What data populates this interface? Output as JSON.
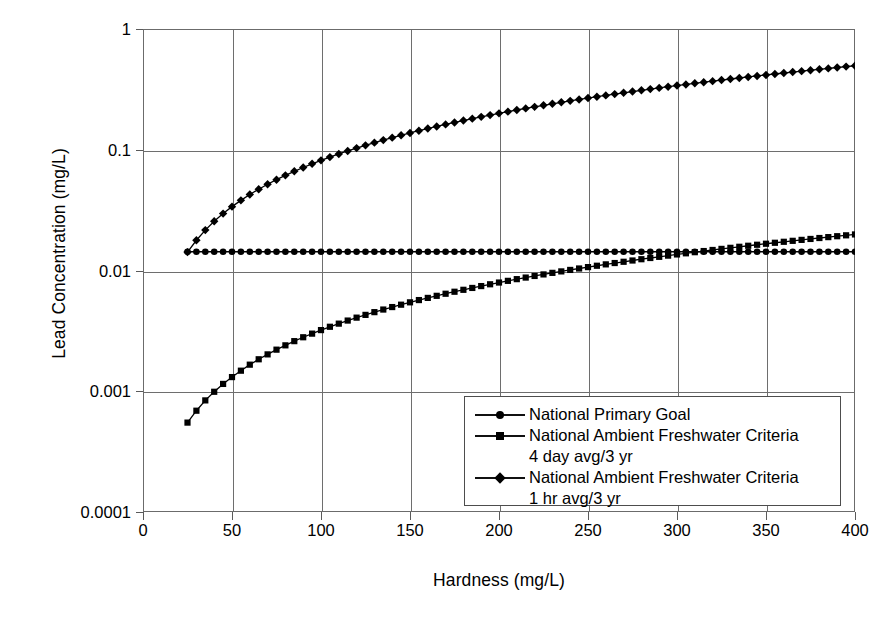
{
  "chart_data": {
    "type": "line",
    "title": "",
    "xlabel": "Hardness (mg/L)",
    "ylabel": "Lead Concentration (mg/L)",
    "yscale": "log",
    "xlim": [
      0,
      400
    ],
    "ylim": [
      0.0001,
      1
    ],
    "grid": true,
    "legend_position": "bottom-right",
    "xticks": [
      "0",
      "50",
      "100",
      "150",
      "200",
      "250",
      "300",
      "350",
      "400"
    ],
    "xtick_values": [
      0,
      50,
      100,
      150,
      200,
      250,
      300,
      350,
      400
    ],
    "yticks": [
      "1",
      "0.1",
      "0.01",
      "0.001",
      "0.0001"
    ],
    "ytick_values": [
      1,
      0.1,
      0.01,
      0.001,
      0.0001
    ],
    "x": [
      25,
      30,
      35,
      40,
      45,
      50,
      55,
      60,
      65,
      70,
      75,
      80,
      85,
      90,
      95,
      100,
      105,
      110,
      115,
      120,
      125,
      130,
      135,
      140,
      145,
      150,
      155,
      160,
      165,
      170,
      175,
      180,
      185,
      190,
      195,
      200,
      205,
      210,
      215,
      220,
      225,
      230,
      235,
      240,
      245,
      250,
      255,
      260,
      265,
      270,
      275,
      280,
      285,
      290,
      295,
      300,
      305,
      310,
      315,
      320,
      325,
      330,
      335,
      340,
      345,
      350,
      355,
      360,
      365,
      370,
      375,
      380,
      385,
      390,
      395,
      400
    ],
    "series": [
      {
        "name": "National Primary Goal",
        "marker": "circle",
        "values": [
          0.0143,
          0.0143,
          0.0143,
          0.0143,
          0.0143,
          0.0143,
          0.0143,
          0.0143,
          0.0143,
          0.0143,
          0.0143,
          0.0143,
          0.0143,
          0.0143,
          0.0143,
          0.0143,
          0.0143,
          0.0143,
          0.0143,
          0.0143,
          0.0143,
          0.0143,
          0.0143,
          0.0143,
          0.0143,
          0.0143,
          0.0143,
          0.0143,
          0.0143,
          0.0143,
          0.0143,
          0.0143,
          0.0143,
          0.0143,
          0.0143,
          0.0143,
          0.0143,
          0.0143,
          0.0143,
          0.0143,
          0.0143,
          0.0143,
          0.0143,
          0.0143,
          0.0143,
          0.0143,
          0.0143,
          0.0143,
          0.0143,
          0.0143,
          0.0143,
          0.0143,
          0.0143,
          0.0143,
          0.0143,
          0.0143,
          0.0143,
          0.0143,
          0.0143,
          0.0143,
          0.0143,
          0.0143,
          0.0143,
          0.0143,
          0.0143,
          0.0143,
          0.0143,
          0.0143,
          0.0143,
          0.0143,
          0.0143,
          0.0143,
          0.0143,
          0.0143,
          0.0143,
          0.0143
        ]
      },
      {
        "name": "National Ambient Freshwater Criteria 4 day avg/3 yr",
        "label_line1": "National Ambient Freshwater Criteria",
        "label_line2": "4 day avg/3 yr",
        "marker": "square",
        "values": [
          0.00055,
          0.00069,
          0.00084,
          0.00099,
          0.00115,
          0.00131,
          0.00148,
          0.00166,
          0.00184,
          0.00202,
          0.00221,
          0.0024,
          0.0026,
          0.0028,
          0.003,
          0.00321,
          0.00342,
          0.00363,
          0.00385,
          0.00407,
          0.00429,
          0.00452,
          0.00475,
          0.00498,
          0.00521,
          0.00545,
          0.00569,
          0.00593,
          0.00617,
          0.00642,
          0.00667,
          0.00692,
          0.00717,
          0.00743,
          0.00769,
          0.00795,
          0.00821,
          0.00848,
          0.00874,
          0.00901,
          0.00928,
          0.00956,
          0.00983,
          0.01011,
          0.01039,
          0.01067,
          0.01095,
          0.01124,
          0.01153,
          0.01181,
          0.0121,
          0.0124,
          0.01269,
          0.01298,
          0.01328,
          0.01358,
          0.01388,
          0.01418,
          0.01449,
          0.01479,
          0.0151,
          0.01541,
          0.01572,
          0.01603,
          0.01634,
          0.01666,
          0.01697,
          0.01729,
          0.01761,
          0.01793,
          0.01825,
          0.01858,
          0.0189,
          0.01923,
          0.01956,
          0.01989
        ]
      },
      {
        "name": "National Ambient Freshwater Criteria 1 hr avg/3 yr",
        "label_line1": "National Ambient Freshwater Criteria",
        "label_line2": "1 hr avg/3 yr",
        "marker": "diamond",
        "values": [
          0.0142,
          0.0178,
          0.0216,
          0.0256,
          0.0296,
          0.0338,
          0.0381,
          0.0426,
          0.0471,
          0.0518,
          0.0565,
          0.0614,
          0.0663,
          0.0713,
          0.0765,
          0.0817,
          0.0869,
          0.0923,
          0.0977,
          0.1032,
          0.1088,
          0.1145,
          0.1202,
          0.126,
          0.1318,
          0.1378,
          0.1437,
          0.1498,
          0.1559,
          0.1621,
          0.1683,
          0.1746,
          0.1809,
          0.1873,
          0.1937,
          0.2002,
          0.2068,
          0.2134,
          0.22,
          0.2267,
          0.2335,
          0.2403,
          0.2471,
          0.254,
          0.2609,
          0.2679,
          0.2749,
          0.282,
          0.2891,
          0.2963,
          0.3035,
          0.3107,
          0.318,
          0.3253,
          0.3327,
          0.3401,
          0.3475,
          0.355,
          0.3625,
          0.3701,
          0.3777,
          0.3853,
          0.393,
          0.4007,
          0.4085,
          0.4163,
          0.4241,
          0.432,
          0.4399,
          0.4478,
          0.4558,
          0.4638,
          0.4718,
          0.4799,
          0.488,
          0.4962
        ]
      }
    ]
  },
  "legend": {
    "rows": [
      {
        "marker": "circle",
        "text": "National Primary Goal"
      },
      {
        "marker": "square",
        "text": "National Ambient Freshwater Criteria"
      },
      {
        "marker": "",
        "text": "4 day avg/3 yr"
      },
      {
        "marker": "diamond",
        "text": "National Ambient Freshwater Criteria"
      },
      {
        "marker": "",
        "text": "1 hr avg/3 yr"
      }
    ]
  },
  "colors": {
    "ink": "#000000",
    "grid": "#6e6e6e",
    "frame": "#6b6b6b",
    "background": "#ffffff"
  }
}
